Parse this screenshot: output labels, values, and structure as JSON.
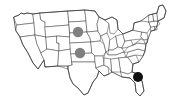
{
  "figure": {
    "type": "map",
    "region": "united-states",
    "projection": "albers-usa-schematic",
    "width": 172,
    "height": 105,
    "background_color": "#ffffff",
    "has_title": false,
    "has_legend": false,
    "has_labels": false,
    "has_axes": false
  },
  "map_style": {
    "state_fill": "#ffffff",
    "state_border_color": "#4a4a4a",
    "state_border_width": 0.55,
    "nation_border_color": "#3a3a3a",
    "nation_border_width": 0.8
  },
  "markers": [
    {
      "id": "marker-north-central",
      "label": "north-central-marker",
      "color": "#808080",
      "x": 78,
      "y": 32,
      "radius": 5.2,
      "shape": "circle",
      "emphasis": "secondary"
    },
    {
      "id": "marker-central-plains",
      "label": "central-plains-marker",
      "color": "#808080",
      "x": 80,
      "y": 53,
      "radius": 5.2,
      "shape": "circle",
      "emphasis": "secondary"
    },
    {
      "id": "marker-southeast",
      "label": "southeast-marker",
      "color": "#111111",
      "x": 138,
      "y": 77,
      "radius": 5.0,
      "shape": "circle",
      "emphasis": "primary"
    }
  ],
  "marker_colors": {
    "primary": "#111111",
    "secondary": "#808080"
  },
  "accessibility": {
    "description": "Outline map of the contiguous United States with three filled circular markers."
  }
}
